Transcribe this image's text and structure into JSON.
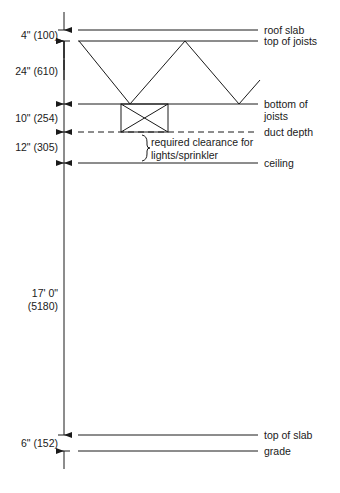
{
  "diagram": {
    "type": "building section - floor-to-floor height",
    "levels": [
      {
        "label": "roof slab",
        "y": 30
      },
      {
        "label": "top of joists",
        "y": 41
      },
      {
        "label_line1": "bottom of",
        "label_line2": "joists",
        "y": 104
      },
      {
        "label": "duct depth",
        "y": 132,
        "style": "dashed"
      },
      {
        "label": "ceiling",
        "y": 163
      },
      {
        "label": "top of slab",
        "y": 435
      },
      {
        "label": "grade",
        "y": 451
      }
    ],
    "dimensions": [
      {
        "text": "4\" (100)"
      },
      {
        "text": "24\" (610)"
      },
      {
        "text": "10\" (254)"
      },
      {
        "text": "12\" (305)"
      },
      {
        "text_line1": "17' 0\"",
        "text_line2": "(5180)"
      },
      {
        "text": "6\" (152)"
      }
    ],
    "annotation": {
      "line1": "required clearance for",
      "line2": "lights/sprinkler"
    },
    "colors": {
      "line": "#1a1a1a",
      "background": "#ffffff"
    }
  }
}
